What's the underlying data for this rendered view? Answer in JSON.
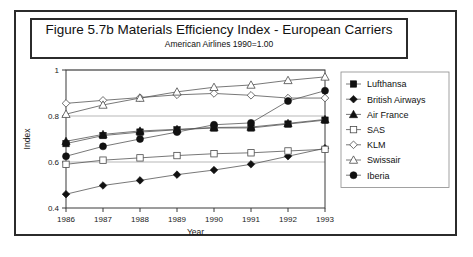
{
  "figure": {
    "title": "Figure 5.7b  Materials Efficiency Index - European Carriers",
    "subtitle": "American Airlines 1990=1.00"
  },
  "chart_data": {
    "type": "line",
    "title": "Figure 5.7b  Materials Efficiency Index - European Carriers",
    "subtitle": "American Airlines 1990=1.00",
    "xlabel": "Year",
    "ylabel": "Index",
    "categories": [
      1986,
      1987,
      1988,
      1989,
      1990,
      1991,
      1992,
      1993
    ],
    "xtick_labels": [
      "1986",
      "1987",
      "1988",
      "1989",
      "1990",
      "1991",
      "1992",
      "1993"
    ],
    "ytick_labels": [
      "0.4",
      "0.6",
      "0.8",
      "1"
    ],
    "yticks": [
      0.4,
      0.6,
      0.8,
      1.0
    ],
    "ylim": [
      0.4,
      1.0
    ],
    "grid": true,
    "legend_position": "right",
    "series": [
      {
        "name": "Lufthansa",
        "marker": "filled-square",
        "values": [
          0.68,
          0.715,
          0.73,
          0.74,
          0.748,
          0.748,
          0.765,
          0.782
        ]
      },
      {
        "name": "British Airways",
        "marker": "filled-diamond",
        "values": [
          0.46,
          0.498,
          0.52,
          0.545,
          0.565,
          0.59,
          0.625,
          0.66
        ]
      },
      {
        "name": "Air France",
        "marker": "filled-triangle",
        "values": [
          0.69,
          0.72,
          0.735,
          0.742,
          0.75,
          0.752,
          0.768,
          0.785
        ]
      },
      {
        "name": "SAS",
        "marker": "open-square",
        "values": [
          0.59,
          0.608,
          0.618,
          0.628,
          0.636,
          0.64,
          0.648,
          0.655
        ]
      },
      {
        "name": "KLM",
        "marker": "open-diamond",
        "values": [
          0.855,
          0.868,
          0.88,
          0.892,
          0.898,
          0.89,
          0.878,
          0.878
        ]
      },
      {
        "name": "Swissair",
        "marker": "open-triangle",
        "values": [
          0.808,
          0.848,
          0.878,
          0.905,
          0.925,
          0.935,
          0.955,
          0.97
        ]
      },
      {
        "name": "Iberia",
        "marker": "filled-circle",
        "values": [
          0.625,
          0.668,
          0.7,
          0.73,
          0.762,
          0.77,
          0.865,
          0.91
        ]
      }
    ]
  }
}
